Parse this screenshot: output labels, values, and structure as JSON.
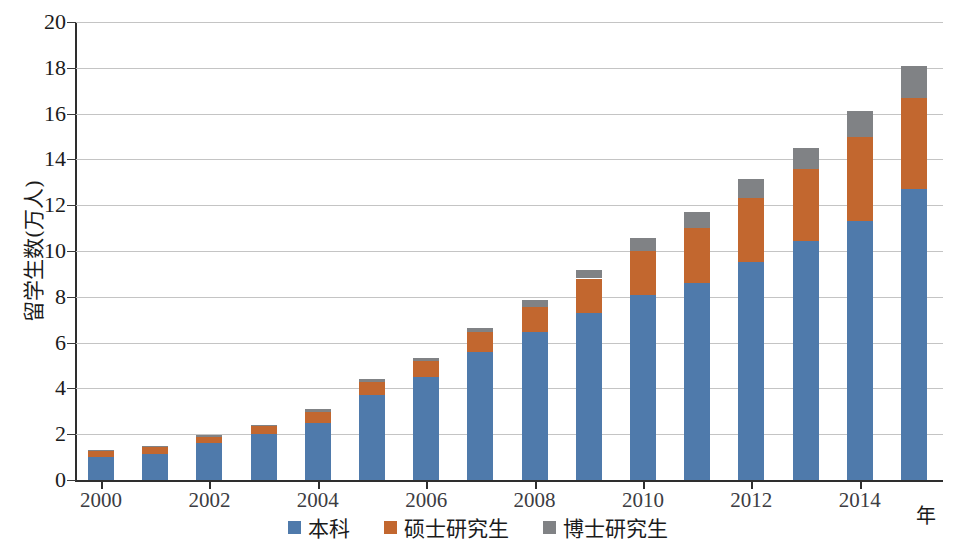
{
  "chart_data": {
    "type": "bar",
    "stacked": true,
    "title": "",
    "xlabel": "年",
    "ylabel": "留学生数(万人)",
    "ylim": [
      0,
      20
    ],
    "ytick_step": 2,
    "yticks": [
      0,
      2,
      4,
      6,
      8,
      10,
      12,
      14,
      16,
      18,
      20
    ],
    "grid": true,
    "legend_position": "bottom-center",
    "categories": [
      "2000",
      "2001",
      "2002",
      "2003",
      "2004",
      "2005",
      "2006",
      "2007",
      "2008",
      "2009",
      "2010",
      "2011",
      "2012",
      "2013",
      "2014",
      "2015"
    ],
    "xtick_labels_shown": [
      "2000",
      "2002",
      "2004",
      "2006",
      "2008",
      "2010",
      "2012",
      "2014"
    ],
    "series": [
      {
        "name": "本科",
        "color": "#4f7aab",
        "values": [
          1.0,
          1.15,
          1.6,
          2.0,
          2.5,
          3.7,
          4.5,
          5.6,
          6.45,
          7.3,
          8.1,
          8.6,
          9.5,
          10.45,
          11.3,
          12.7
        ]
      },
      {
        "name": "硕士研究生",
        "color": "#c2672f",
        "values": [
          0.25,
          0.3,
          0.3,
          0.35,
          0.45,
          0.6,
          0.7,
          0.85,
          1.1,
          1.5,
          1.9,
          2.4,
          2.8,
          3.15,
          3.7,
          4.0
        ]
      },
      {
        "name": "博士研究生",
        "color": "#808285",
        "values": [
          0.05,
          0.05,
          0.05,
          0.05,
          0.15,
          0.1,
          0.15,
          0.2,
          0.3,
          0.35,
          0.55,
          0.7,
          0.85,
          0.9,
          1.1,
          1.4
        ]
      }
    ],
    "totals": [
      1.3,
      1.5,
      1.95,
      2.4,
      3.1,
      4.4,
      5.35,
      6.65,
      7.85,
      9.15,
      10.55,
      11.7,
      13.15,
      14.5,
      16.1,
      18.1
    ]
  },
  "legend": {
    "items": [
      {
        "label": "本科",
        "color": "#4f7aab"
      },
      {
        "label": "硕士研究生",
        "color": "#c2672f"
      },
      {
        "label": "博士研究生",
        "color": "#808285"
      }
    ]
  },
  "axes": {
    "y_title": "留学生数(万人)",
    "x_title": "年"
  }
}
